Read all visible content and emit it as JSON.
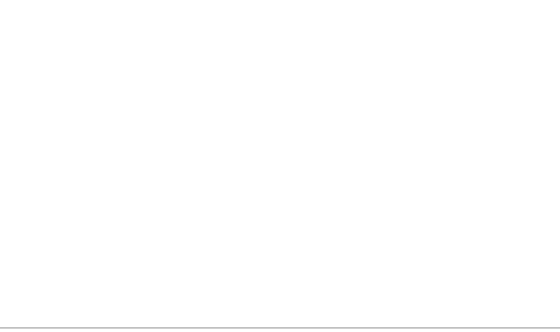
{
  "diagram": {
    "title_partial": "...ship / customer activity cycle",
    "stages": [
      {
        "label": "Relationship\ninitiation",
        "items": [
          "The company\nexposes the\ncustomer to its\nmarketing message",
          "The customer\nseeks relevant\ninformation"
        ]
      },
      {
        "label": "Provider\nevaluation",
        "items": [
          "The customer\ngets initial price\nand lead-time\nquotes",
          "The customer\nputs out an\nRFP",
          "The customer\nevaluates\nproviders and\nnegotiates\nterms and pricing",
          "The customer\nselects the\nprovider"
        ]
      },
      {
        "label": "Account\nsetup",
        "items": [
          "The customer\nobtains materials\nfor account\nsetup",
          "The customer\nprovides account\nprofile information",
          "The\ncompany\nconfirms\nsetup and\nactivation",
          "The company\nperforms courtesy\nfollow-up",
          "The customer\nrequests product\ninformation"
        ]
      },
      {
        "label": "Order\nplacement",
        "items": [
          "The\ncustomer\nselects the\nproduct",
          "The customer\nplaces the order\n(fills out the\norder form)",
          "The customer\nprepares specialty\ndocuments when\nrequired (for\nexample, for\nrush delivery)",
          "The company\nand the customer\narrange initial\ndelivery terms"
        ]
      },
      {
        "label": "Product\nreception\nand use",
        "items": [
          "The customer\ntracks\norder\nstatus",
          "The company\nand the customer\narrange the final\ndelivery terms",
          "The customer\nreceives and\ninspects\nthe product",
          "The customer\nrefuses or accepts\nthe product"
        ]
      },
      {
        "label": "Problem\nresolution",
        "items": [
          "The customer\nfiles a claim\nand obtains\nresolution",
          "The customer\nnotifies the company\nof a problem and\nobtains resolution",
          "The customer\nseeks an invoice\nadjustment and\nobtains resolution"
        ]
      },
      {
        "label": "Payment",
        "items": [
          "The customer\nreceives\nand validates\nthe invoice",
          "The customer\nmakes the\npayment"
        ]
      },
      {
        "label": "Account\nmaintenance",
        "items": [
          "The customer\nmaintains\nprofile\ninformation",
          "The customer\nmaintains\nsupplies",
          "The company\nprovides general\nsupport (not\nrelated to problems)",
          "The customer\nobtains\nongoing\nprice quotes"
        ]
      }
    ]
  }
}
